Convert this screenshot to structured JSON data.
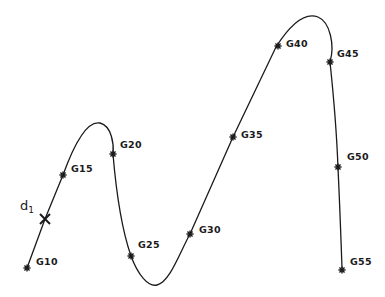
{
  "diagram": {
    "curve_path": "M 27 268 L 45 219 L 63 175 C 72 150, 85 120, 100 123 C 112 126, 114 145, 113 154 C 116 190, 122 230, 131 256 C 138 275, 148 287, 157 285 C 170 282, 180 252, 190 234 L 233 137 L 276 47 C 290 25, 305 12, 318 17 C 330 22, 335 45, 330 62 C 334 100, 337 140, 338 168 C 340 210, 341 240, 342 268",
    "stroke_color": "#1a1a1a",
    "points": [
      {
        "id": "G10",
        "label": "G10",
        "x": 27,
        "y": 268,
        "lx": 36,
        "ly": 265
      },
      {
        "id": "G15",
        "label": "G15",
        "x": 63,
        "y": 175,
        "lx": 71,
        "ly": 172
      },
      {
        "id": "G20",
        "label": "G20",
        "x": 113,
        "y": 154,
        "lx": 120,
        "ly": 148
      },
      {
        "id": "G25",
        "label": "G25",
        "x": 131,
        "y": 256,
        "lx": 138,
        "ly": 248
      },
      {
        "id": "G30",
        "label": "G30",
        "x": 190,
        "y": 234,
        "lx": 199,
        "ly": 233
      },
      {
        "id": "G35",
        "label": "G35",
        "x": 233,
        "y": 137,
        "lx": 241,
        "ly": 138
      },
      {
        "id": "G40",
        "label": "G40",
        "x": 278,
        "y": 46,
        "lx": 286,
        "ly": 47
      },
      {
        "id": "G45",
        "label": "G45",
        "x": 330,
        "y": 62,
        "lx": 337,
        "ly": 57
      },
      {
        "id": "G50",
        "label": "G50",
        "x": 338,
        "y": 167,
        "lx": 347,
        "ly": 160
      },
      {
        "id": "G55",
        "label": "G55",
        "x": 342,
        "y": 270,
        "lx": 350,
        "ly": 265
      }
    ],
    "cross_marker": {
      "id": "d1",
      "label_main": "d",
      "label_sub": "1",
      "x": 45,
      "y": 219,
      "lx": 20,
      "ly": 210
    }
  }
}
